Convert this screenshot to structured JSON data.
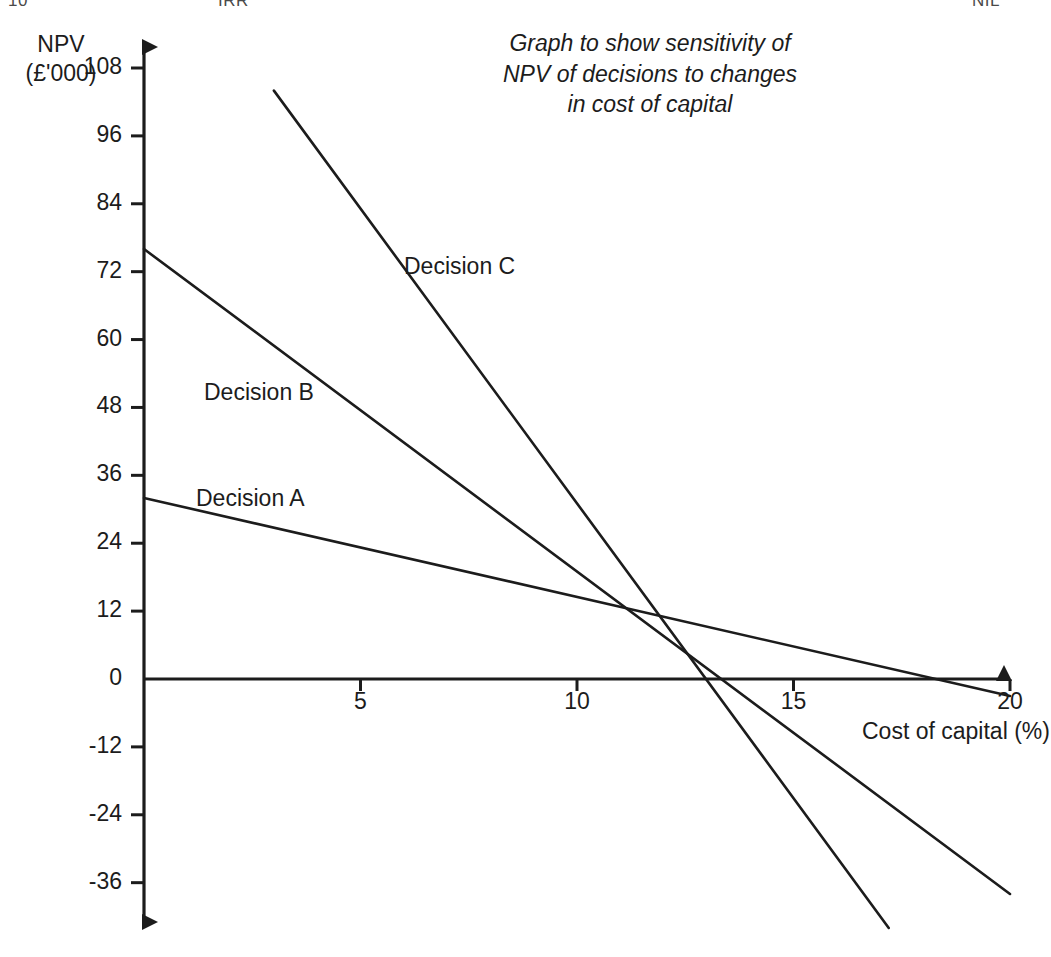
{
  "page": {
    "width": 1051,
    "height": 957,
    "background": "#ffffff",
    "ink": "#1c1c1c"
  },
  "top_fragments": {
    "left": "10",
    "middle": "IRR",
    "right": "NIL"
  },
  "chart_data": {
    "type": "line",
    "title": "Graph to show sensitivity of NPV of decisions to changes in cost of capital",
    "title_lines": [
      "Graph to show sensitivity of",
      "NPV of decisions to changes",
      "in cost of capital"
    ],
    "xlabel": "Cost of capital (%)",
    "ylabel": "NPV (£'000)",
    "ylabel_lines": [
      "NPV",
      "(£'000)"
    ],
    "xlim": [
      0,
      20
    ],
    "ylim": [
      -36,
      108
    ],
    "xticks": [
      5,
      10,
      15,
      20
    ],
    "xtick_labels": [
      "5",
      "10",
      "15",
      "20"
    ],
    "yticks": [
      108,
      96,
      84,
      72,
      60,
      48,
      36,
      24,
      12,
      0,
      -12,
      -24,
      -36
    ],
    "ytick_labels": [
      "108",
      "96",
      "84",
      "72",
      "60",
      "48",
      "36",
      "24",
      "12",
      "0",
      "-12",
      "-24",
      "-36"
    ],
    "grid": false,
    "legend": "inline-annotations",
    "series": [
      {
        "name": "Decision A",
        "label": "Decision A",
        "color": "#1c1c1c",
        "x": [
          0,
          20
        ],
        "y": [
          32,
          -3
        ],
        "irr": 17.7
      },
      {
        "name": "Decision B",
        "label": "Decision B",
        "color": "#1c1c1c",
        "x": [
          0,
          20
        ],
        "y": [
          76,
          -38
        ],
        "irr": 13.3
      },
      {
        "name": "Decision C",
        "label": "Decision C",
        "color": "#1c1c1c",
        "x": [
          3,
          17.2
        ],
        "y": [
          104,
          -44
        ],
        "irr": 13.0
      }
    ],
    "annotations": [
      {
        "text": "Decision A",
        "x": 1.2,
        "y": 30
      },
      {
        "text": "Decision B",
        "x": 1.4,
        "y": 49
      },
      {
        "text": "Decision C",
        "x": 6.0,
        "y": 71
      }
    ]
  }
}
